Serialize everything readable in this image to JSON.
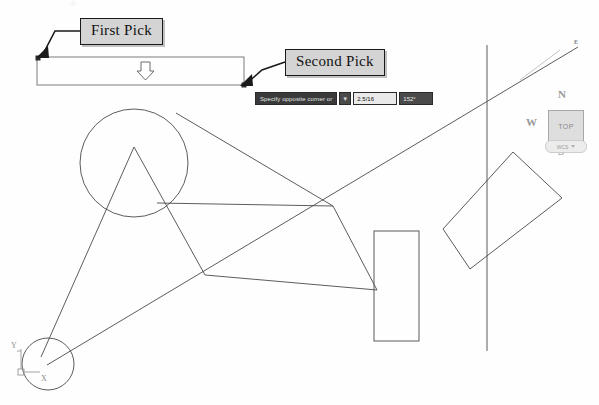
{
  "app": {
    "title": "AutoCAD Crossing Window Selection",
    "background_color": "#fefefe",
    "geometry_stroke": "#4a4a4a",
    "annotation_fill": "#d4d4d4",
    "annotation_border": "#1a1a1a"
  },
  "annotations": [
    {
      "id": "first-pick",
      "label": "First Pick",
      "x": 80,
      "y": 18
    },
    {
      "id": "second-pick",
      "label": "Second Pick",
      "x": 285,
      "y": 49
    }
  ],
  "callouts": {
    "first_pick": "First Pick",
    "second_pick": "Second Pick"
  },
  "command_bar": {
    "prompt": "Specify opposite corner or",
    "dropdown_glyph": "▼",
    "distance_value": "2.5/16",
    "angle_value": "152°"
  },
  "selection_window": {
    "x": 37,
    "y": 57,
    "width": 207,
    "height": 28,
    "border_color": "#6e6e6e",
    "first_pick_marker": "top-left",
    "second_pick_marker": "bottom-right",
    "cursor_glyph": "down-arrow"
  },
  "viewcube": {
    "north": "N",
    "west": "W",
    "south": "S",
    "east": "E",
    "face": "TOP",
    "coordinate_system": "WCS"
  },
  "ucs_icon": {
    "x_label": "X",
    "y_label": "Y",
    "origin_x": 22,
    "origin_y": 372
  },
  "drawing": {
    "description": "AutoCAD model space linework: circles, triangles, rectangles and construction lines",
    "stroke_color": "#4a4a4a",
    "entities": [
      {
        "type": "circle",
        "name": "upper-circle",
        "cx": 134,
        "cy": 163,
        "r": 54
      },
      {
        "type": "circle",
        "name": "lower-left-circle",
        "cx": 48,
        "cy": 364,
        "r": 26
      },
      {
        "type": "rect",
        "name": "vertical-rectangle",
        "x": 374,
        "y": 231,
        "width": 45,
        "height": 110
      },
      {
        "type": "polygon",
        "name": "rotated-rectangle",
        "points": "513,153 561,198 470,268 443,229"
      },
      {
        "type": "line",
        "name": "vertical-construction-line",
        "x1": 487,
        "y1": 46,
        "x2": 487,
        "y2": 350
      },
      {
        "type": "line",
        "name": "long-diagonal-line",
        "x1": 48,
        "y1": 364,
        "x2": 577,
        "y2": 48
      },
      {
        "type": "line",
        "name": "apex-to-lower-left",
        "x1": 134,
        "y1": 147,
        "x2": 40,
        "y2": 358
      },
      {
        "type": "line",
        "name": "apex-to-mid-node",
        "x1": 134,
        "y1": 147,
        "x2": 204,
        "y2": 275
      },
      {
        "type": "line",
        "name": "circle-edge-to-right-node",
        "x1": 156,
        "y1": 203,
        "x2": 333,
        "y2": 206
      },
      {
        "type": "line",
        "name": "circle-edge-to-upper-right",
        "x1": 156,
        "y1": 203,
        "x2": 333,
        "y2": 206
      },
      {
        "type": "line",
        "name": "top-node-to-right-node",
        "x1": 176,
        "y1": 113,
        "x2": 333,
        "y2": 206
      },
      {
        "type": "line",
        "name": "right-node-to-rect",
        "x1": 333,
        "y1": 206,
        "x2": 376,
        "y2": 289
      },
      {
        "type": "line",
        "name": "mid-node-to-rect",
        "x1": 204,
        "y1": 275,
        "x2": 376,
        "y2": 289
      }
    ]
  }
}
